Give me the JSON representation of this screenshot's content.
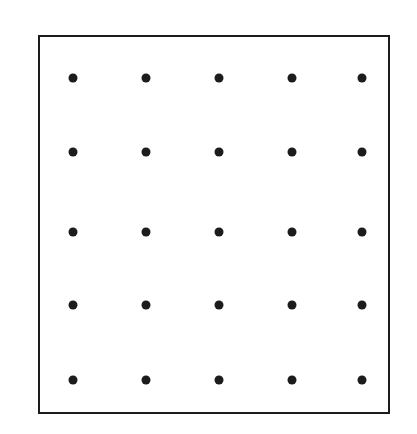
{
  "figure": {
    "caption": "",
    "background_color": "#ffffff"
  },
  "frame": {
    "name": "rectangular-border",
    "x": 38,
    "y": 35,
    "width": 352,
    "height": 379,
    "border_width": 2,
    "border_color": "#1c1c1c",
    "fill_color": "#ffffff"
  },
  "dots": {
    "color": "#1c1c1c",
    "diameter": 9,
    "rows": 5,
    "columns": 5,
    "column_x": [
      73,
      146,
      219,
      292,
      362
    ],
    "row_y": [
      78,
      152,
      232,
      305,
      380
    ],
    "count": 25
  },
  "chart_data": {
    "type": "scatter",
    "xlabel": "",
    "ylabel": "",
    "grid": false,
    "legend": null,
    "xlim": [
      38,
      390
    ],
    "ylim": [
      35,
      414
    ],
    "xticks": [],
    "yticks": [],
    "marker": "filled-circle",
    "marker_color": "#1c1c1c",
    "marker_size": 9,
    "series": [
      {
        "name": "lattice-points",
        "x": [
          73,
          146,
          219,
          292,
          362,
          73,
          146,
          219,
          292,
          362,
          73,
          146,
          219,
          292,
          362,
          73,
          146,
          219,
          292,
          362,
          73,
          146,
          219,
          292,
          362
        ],
        "y": [
          78,
          78,
          78,
          78,
          78,
          152,
          152,
          152,
          152,
          152,
          232,
          232,
          232,
          232,
          232,
          305,
          305,
          305,
          305,
          305,
          380,
          380,
          380,
          380,
          380
        ]
      }
    ],
    "annotations": []
  }
}
